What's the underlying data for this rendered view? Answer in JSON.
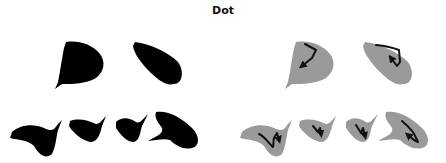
{
  "title": "Dot",
  "colors": {
    "silhouette": "#000000",
    "shape_fill": "#9a9a9a",
    "stroke": "#111111",
    "background": "#ffffff"
  },
  "panels": [
    {
      "name": "silhouettes",
      "description": "Black filled shapes",
      "shapes": 6
    },
    {
      "name": "trajectories",
      "description": "Gray shapes with drawn stroke arrows",
      "shapes": 6
    }
  ]
}
